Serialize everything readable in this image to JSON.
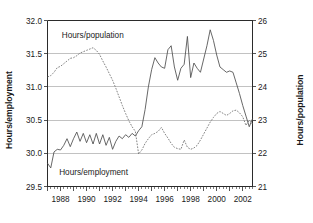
{
  "chart_data": {
    "type": "line",
    "title": "",
    "xlabel": "",
    "grid": true,
    "legend_position": "inline-annotations",
    "xlim": [
      1987.0,
      2002.75
    ],
    "x_tick_labels": [
      "1988",
      "1990",
      "1992",
      "1994",
      "1996",
      "1998",
      "2000",
      "2002"
    ],
    "x_tick_values": [
      1988,
      1990,
      1992,
      1994,
      1996,
      1998,
      2000,
      2002
    ],
    "x_minor_step": 0.25,
    "axes": {
      "left": {
        "label": "Hours/employment",
        "ylim": [
          29.5,
          32.0
        ],
        "ticks": [
          29.5,
          30.0,
          30.5,
          31.0,
          31.5,
          32.0
        ],
        "tick_labels": [
          "29.5",
          "30.0",
          "30.5",
          "31.0",
          "31.5",
          "32.0"
        ]
      },
      "right": {
        "label": "Hours/population",
        "ylim": [
          21,
          26
        ],
        "ticks": [
          21,
          22,
          23,
          24,
          25,
          26
        ],
        "tick_labels": [
          "21",
          "22",
          "23",
          "24",
          "25",
          "26"
        ]
      }
    },
    "annotations": [
      {
        "name": "hours-population-label",
        "text": "Hours/population",
        "x": 1988.1,
        "y_px": 38
      },
      {
        "name": "hours-employment-label",
        "text": "Hours/employment",
        "x": 1987.9,
        "y_px": 175
      }
    ],
    "series": [
      {
        "name": "Hours/employment",
        "style": "solid",
        "axis": "left",
        "color": "#4d4d4d",
        "x": [
          1987.0,
          1987.25,
          1987.5,
          1987.75,
          1988.0,
          1988.25,
          1988.5,
          1988.75,
          1989.0,
          1989.25,
          1989.5,
          1989.75,
          1990.0,
          1990.25,
          1990.5,
          1990.75,
          1991.0,
          1991.25,
          1991.5,
          1991.75,
          1992.0,
          1992.25,
          1992.5,
          1992.75,
          1993.0,
          1993.25,
          1993.5,
          1993.75,
          1994.0,
          1994.25,
          1994.5,
          1994.75,
          1995.0,
          1995.25,
          1995.5,
          1995.75,
          1996.0,
          1996.25,
          1996.5,
          1996.75,
          1997.0,
          1997.25,
          1997.5,
          1997.75,
          1998.0,
          1998.25,
          1998.5,
          1998.75,
          1999.0,
          1999.25,
          1999.5,
          1999.75,
          2000.0,
          2000.25,
          2000.5,
          2000.75,
          2001.0,
          2001.25,
          2001.5,
          2001.75,
          2002.0,
          2002.25,
          2002.5,
          2002.75
        ],
        "values": [
          29.85,
          29.78,
          30.02,
          30.06,
          30.05,
          30.12,
          30.22,
          30.1,
          30.22,
          30.32,
          30.18,
          30.3,
          30.16,
          30.28,
          30.14,
          30.3,
          30.14,
          30.28,
          30.12,
          30.24,
          30.06,
          30.18,
          30.26,
          30.22,
          30.28,
          30.24,
          30.3,
          30.26,
          30.34,
          30.4,
          30.66,
          31.0,
          31.26,
          31.44,
          31.36,
          31.3,
          31.28,
          31.56,
          31.62,
          31.3,
          31.1,
          31.28,
          31.34,
          31.76,
          31.14,
          31.36,
          31.28,
          31.22,
          31.42,
          31.62,
          31.86,
          31.7,
          31.48,
          31.3,
          31.26,
          31.22,
          31.24,
          31.22,
          31.06,
          30.9,
          30.72,
          30.56,
          30.4,
          30.52
        ]
      },
      {
        "name": "Hours/population",
        "style": "dashed",
        "axis": "right",
        "color": "#6e6e6e",
        "x": [
          1987.0,
          1987.25,
          1987.5,
          1987.75,
          1988.0,
          1988.25,
          1988.5,
          1988.75,
          1989.0,
          1989.25,
          1989.5,
          1989.75,
          1990.0,
          1990.25,
          1990.5,
          1990.75,
          1991.0,
          1991.25,
          1991.5,
          1991.75,
          1992.0,
          1992.25,
          1992.5,
          1992.75,
          1993.0,
          1993.25,
          1993.5,
          1993.75,
          1994.0,
          1994.25,
          1994.5,
          1994.75,
          1995.0,
          1995.25,
          1995.5,
          1995.75,
          1996.0,
          1996.25,
          1996.5,
          1996.75,
          1997.0,
          1997.25,
          1997.5,
          1997.75,
          1998.0,
          1998.25,
          1998.5,
          1998.75,
          1999.0,
          1999.25,
          1999.5,
          1999.75,
          2000.0,
          2000.25,
          2000.5,
          2000.75,
          2001.0,
          2001.25,
          2001.5,
          2001.75,
          2002.0,
          2002.25,
          2002.5,
          2002.75
        ],
        "values": [
          24.3,
          24.34,
          24.44,
          24.58,
          24.62,
          24.7,
          24.78,
          24.86,
          24.88,
          24.94,
          25.02,
          25.06,
          25.1,
          25.14,
          25.18,
          25.1,
          24.98,
          24.78,
          24.6,
          24.4,
          24.2,
          23.96,
          23.7,
          23.44,
          23.2,
          22.98,
          22.8,
          22.66,
          21.98,
          22.1,
          22.3,
          22.44,
          22.56,
          22.6,
          22.66,
          22.78,
          22.6,
          22.46,
          22.3,
          22.18,
          22.14,
          22.12,
          22.4,
          22.18,
          22.12,
          22.16,
          22.24,
          22.4,
          22.58,
          22.76,
          22.94,
          23.08,
          23.2,
          23.26,
          23.2,
          23.14,
          23.2,
          23.28,
          23.3,
          23.22,
          23.1,
          22.84,
          23.0,
          22.88
        ]
      }
    ]
  }
}
